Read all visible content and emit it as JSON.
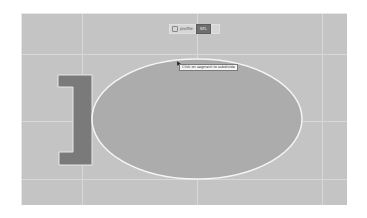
{
  "toolbar": {
    "items": [
      {
        "label": "profile",
        "icon": "profile-icon",
        "active": false
      },
      {
        "label": "SEL",
        "active": true
      }
    ]
  },
  "tooltip": {
    "text": "Click on segment to subdivide"
  },
  "canvas": {
    "background": "#c4c4c4",
    "ellipse": {
      "cx": 175,
      "cy": 105,
      "rx": 105,
      "ry": 60,
      "fill": "#acacac",
      "stroke": "#f5f5f5"
    },
    "bracket_shape": {
      "fill": "#7a7a7a",
      "stroke": "#e8e8e8"
    },
    "grid_color": "#d8d8d8"
  }
}
